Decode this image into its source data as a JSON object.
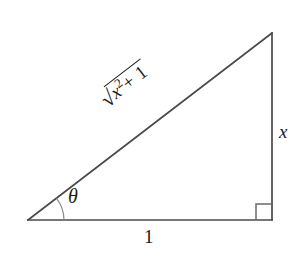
{
  "figure": {
    "kind": "right-triangle-trigonometry-diagram",
    "background_color": "#ffffff",
    "stroke_color": "#4a4a4a",
    "text_color": "#1a1a1a"
  },
  "geometry": {
    "vertices": {
      "left": {
        "x": 28,
        "y": 220
      },
      "bottom_right": {
        "x": 272,
        "y": 220
      },
      "top_right": {
        "x": 272,
        "y": 33
      }
    },
    "base_length_px": 244,
    "height_px": 187,
    "angle_theta_degrees": 37.5,
    "right_angle_marker": {
      "size_px": 16,
      "corner": "bottom-right"
    },
    "angle_arc": {
      "radius_px": 36,
      "at_vertex": "left"
    }
  },
  "labels": {
    "theta": "θ",
    "opposite_side": "x",
    "adjacent_side": "1",
    "hypotenuse": {
      "radical_sign": "√",
      "radicand_base": "x",
      "radicand_exponent": "2",
      "radicand_rest": "+ 1",
      "full_text": "√(x² + 1)"
    }
  }
}
